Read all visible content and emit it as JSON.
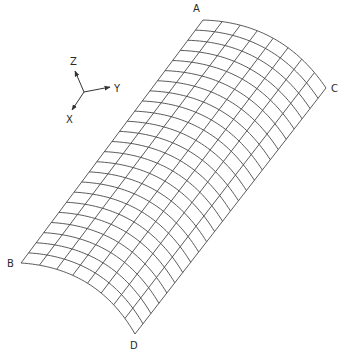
{
  "figure": {
    "corners": [
      {
        "label": "A",
        "x": 203,
        "y": 20,
        "label_x": 193,
        "label_y": 12
      },
      {
        "label": "C",
        "x": 326,
        "y": 88,
        "label_x": 331,
        "label_y": 92
      },
      {
        "label": "B",
        "x": 21,
        "y": 263,
        "label_x": 7,
        "label_y": 267
      },
      {
        "label": "D",
        "x": 135,
        "y": 334,
        "label_x": 130,
        "label_y": 349
      }
    ],
    "mesh": {
      "divisions_across": 8,
      "divisions_along": 24,
      "arc_sagitta_px": 18,
      "line_color": "#4a4a4a"
    },
    "axes": {
      "origin": {
        "x": 84,
        "y": 92
      },
      "items": [
        {
          "label": "Z",
          "x": 75,
          "y": 71,
          "label_x": 70,
          "label_y": 65
        },
        {
          "label": "Y",
          "x": 110,
          "y": 87,
          "label_x": 114,
          "label_y": 92
        },
        {
          "label": "X",
          "x": 72,
          "y": 110,
          "label_x": 66,
          "label_y": 123
        }
      ]
    }
  }
}
